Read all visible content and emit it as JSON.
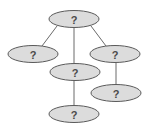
{
  "diagram": {
    "type": "tree",
    "colors": {
      "node_fill": "#dcdcdc",
      "node_stroke": "#5a5a5a",
      "edge": "#6a6a6a",
      "label": "#4a4a4a"
    },
    "nodes": [
      {
        "id": "root",
        "label": "?",
        "cx": 74,
        "cy": 19,
        "rx": 25,
        "ry": 8.5
      },
      {
        "id": "left",
        "label": "?",
        "cx": 33,
        "cy": 54,
        "rx": 25,
        "ry": 8.5
      },
      {
        "id": "middle",
        "label": "?",
        "cx": 75,
        "cy": 72,
        "rx": 25,
        "ry": 8.5
      },
      {
        "id": "right",
        "label": "?",
        "cx": 115,
        "cy": 54,
        "rx": 25,
        "ry": 8.5
      },
      {
        "id": "middle-child",
        "label": "?",
        "cx": 74,
        "cy": 114,
        "rx": 25,
        "ry": 8.5
      },
      {
        "id": "right-child",
        "label": "?",
        "cx": 116,
        "cy": 93,
        "rx": 25,
        "ry": 8.5
      }
    ],
    "edges": [
      {
        "from": "root",
        "to": "left",
        "x1": 57,
        "y1": 26,
        "x2": 42,
        "y2": 46
      },
      {
        "from": "root",
        "to": "middle",
        "x1": 74,
        "y1": 27.5,
        "x2": 74,
        "y2": 63.5
      },
      {
        "from": "root",
        "to": "right",
        "x1": 91,
        "y1": 26,
        "x2": 106,
        "y2": 46
      },
      {
        "from": "middle",
        "to": "middle-child",
        "x1": 74,
        "y1": 80.5,
        "x2": 74,
        "y2": 105.5
      },
      {
        "from": "right",
        "to": "right-child",
        "x1": 116,
        "y1": 62.5,
        "x2": 116,
        "y2": 84.5
      }
    ]
  }
}
